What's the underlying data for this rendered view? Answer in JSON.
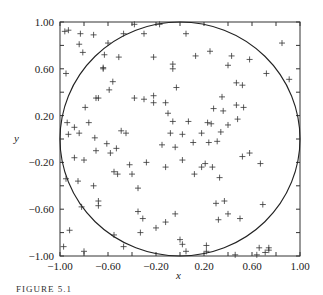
{
  "chart_data": {
    "type": "scatter",
    "title": "",
    "xlabel": "x",
    "ylabel": "y",
    "xlim": [
      -1.0,
      1.0
    ],
    "ylim": [
      -1.0,
      1.0
    ],
    "xticks": [
      -1.0,
      -0.6,
      -0.2,
      0.2,
      0.6,
      1.0
    ],
    "yticks": [
      -1.0,
      -0.6,
      -0.2,
      0.2,
      0.6,
      1.0
    ],
    "xtick_labels": [
      "−1.00",
      "−0.60",
      "−0.20",
      "0.20",
      "0.60",
      "1.00"
    ],
    "ytick_labels": [
      "−1.00",
      "−0.60",
      "−0.20",
      "0.20",
      "0.60",
      "1.00"
    ],
    "minor_ticks_every": 0.2,
    "grid": false,
    "legend": null,
    "marker": "+",
    "overlay": {
      "shape": "circle",
      "center": [
        0,
        0
      ],
      "radius": 1
    },
    "points": [
      [
        -0.96,
        0.92
      ],
      [
        -0.93,
        0.93
      ],
      [
        -0.83,
        0.9
      ],
      [
        -0.72,
        0.89
      ],
      [
        -0.6,
        0.82
      ],
      [
        -0.47,
        0.9
      ],
      [
        -0.3,
        0.9
      ],
      [
        -0.38,
        0.98
      ],
      [
        -0.17,
        0.98
      ],
      [
        0.05,
        0.9
      ],
      [
        -0.84,
        0.81
      ],
      [
        -0.81,
        0.74
      ],
      [
        -0.63,
        0.72
      ],
      [
        -0.51,
        0.7
      ],
      [
        -0.22,
        0.7
      ],
      [
        0.13,
        0.71
      ],
      [
        0.25,
        0.75
      ],
      [
        0.43,
        0.71
      ],
      [
        0.58,
        0.68
      ],
      [
        0.72,
        0.56
      ],
      [
        0.85,
        0.82
      ],
      [
        0.91,
        0.51
      ],
      [
        -0.95,
        0.56
      ],
      [
        -0.64,
        0.6
      ],
      [
        -0.64,
        0.61
      ],
      [
        -0.56,
        0.49
      ],
      [
        -0.59,
        0.42
      ],
      [
        -0.79,
        0.27
      ],
      [
        -0.68,
        0.35
      ],
      [
        -0.7,
        0.35
      ],
      [
        -0.38,
        0.35
      ],
      [
        -0.22,
        0.37
      ],
      [
        -0.03,
        0.44
      ],
      [
        -0.06,
        0.6
      ],
      [
        -0.06,
        0.64
      ],
      [
        0.4,
        0.63
      ],
      [
        0.52,
        0.46
      ],
      [
        0.47,
        0.48
      ],
      [
        0.35,
        0.36
      ],
      [
        0.47,
        0.29
      ],
      [
        0.53,
        0.27
      ],
      [
        0.48,
        0.17
      ],
      [
        -0.94,
        0.14
      ],
      [
        -0.88,
        0.1
      ],
      [
        -0.76,
        0.14
      ],
      [
        -0.93,
        0.04
      ],
      [
        -0.84,
        0.05
      ],
      [
        -0.71,
        0.01
      ],
      [
        -0.61,
        -0.04
      ],
      [
        -0.53,
        -0.08
      ],
      [
        -0.49,
        0.07
      ],
      [
        -0.3,
        0.34
      ],
      [
        -0.45,
        0.05
      ],
      [
        -0.12,
        0.31
      ],
      [
        -0.22,
        0.31
      ],
      [
        -0.1,
        0.22
      ],
      [
        0.07,
        0.15
      ],
      [
        -0.06,
        0.15
      ],
      [
        -0.08,
        0.05
      ],
      [
        -0.15,
        -0.05
      ],
      [
        -0.04,
        -0.07
      ],
      [
        0.11,
        -0.03
      ],
      [
        0.02,
        -0.18
      ],
      [
        -0.12,
        -0.24
      ],
      [
        0.21,
        -0.21
      ],
      [
        0.18,
        -0.24
      ],
      [
        0.28,
        0.26
      ],
      [
        0.36,
        0.24
      ],
      [
        0.23,
        0.14
      ],
      [
        0.26,
        0.13
      ],
      [
        0.4,
        0.12
      ],
      [
        0.02,
        0.04
      ],
      [
        0.18,
        0.05
      ],
      [
        0.34,
        0.06
      ],
      [
        0.24,
        -0.03
      ],
      [
        0.31,
        -0.02
      ],
      [
        -0.7,
        -0.1
      ],
      [
        -0.58,
        -0.12
      ],
      [
        -0.88,
        -0.16
      ],
      [
        -0.8,
        -0.18
      ],
      [
        -0.42,
        -0.22
      ],
      [
        -0.28,
        -0.2
      ],
      [
        -0.85,
        -0.36
      ],
      [
        -0.72,
        -0.4
      ],
      [
        -0.55,
        -0.28
      ],
      [
        -0.52,
        -0.3
      ],
      [
        0.12,
        -0.3
      ],
      [
        0.27,
        -0.24
      ],
      [
        0.33,
        -0.33
      ],
      [
        0.52,
        -0.15
      ],
      [
        0.58,
        -0.12
      ],
      [
        0.67,
        -0.21
      ],
      [
        -0.4,
        -0.3
      ],
      [
        -0.35,
        -0.42
      ],
      [
        -0.95,
        -0.34
      ],
      [
        -0.82,
        -0.58
      ],
      [
        -0.68,
        -0.53
      ],
      [
        -0.68,
        -0.57
      ],
      [
        -0.35,
        -0.62
      ],
      [
        -0.31,
        -0.68
      ],
      [
        -0.33,
        -0.8
      ],
      [
        -0.2,
        -0.76
      ],
      [
        -0.92,
        -0.78
      ],
      [
        -0.97,
        -0.92
      ],
      [
        -0.8,
        -0.96
      ],
      [
        -0.55,
        -0.82
      ],
      [
        -0.47,
        -0.92
      ],
      [
        -0.12,
        -0.71
      ],
      [
        -0.04,
        -0.64
      ],
      [
        0.0,
        -0.86
      ],
      [
        0.02,
        -0.9
      ],
      [
        0.05,
        -0.96
      ],
      [
        0.3,
        -0.55
      ],
      [
        0.37,
        -0.53
      ],
      [
        0.32,
        -0.69
      ],
      [
        0.4,
        -0.64
      ],
      [
        0.5,
        -0.68
      ],
      [
        0.69,
        -0.56
      ],
      [
        0.66,
        -0.93
      ],
      [
        0.74,
        -0.93
      ],
      [
        0.74,
        -0.95
      ],
      [
        0.22,
        -0.91
      ],
      [
        0.22,
        -0.96
      ],
      [
        0.46,
        -0.99
      ],
      [
        0.64,
        -0.99
      ],
      [
        0.71,
        -0.97
      ]
    ]
  },
  "axes": {
    "x_label": "x",
    "y_label": "y"
  },
  "caption": "FIGURE 5.1"
}
